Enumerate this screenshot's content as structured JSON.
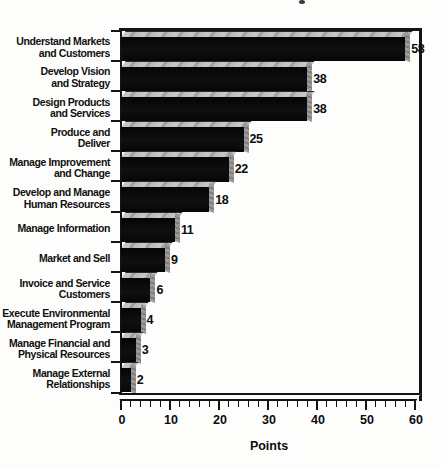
{
  "chart_data": {
    "type": "bar",
    "orientation": "horizontal",
    "title": "",
    "xlabel": "Points",
    "ylabel": "",
    "xlim": [
      0,
      60
    ],
    "x_major_ticks": [
      0,
      10,
      20,
      30,
      40,
      50,
      60
    ],
    "x_minor_tick_step": 2,
    "grid": false,
    "legend_position": "none",
    "value_labels_shown": true,
    "bar_color": "#0b0b0b",
    "bar_top_highlight_color": "#b8b8b8",
    "bar_end_face_color": "#8f8f8f",
    "frame_color": "#141414",
    "categories": [
      "Understand Markets and Customers",
      "Develop Vision and Strategy",
      "Design Products and Services",
      "Produce and Deliver",
      "Manage Improvement and Change",
      "Develop and Manage Human Resources",
      "Manage Information",
      "Market and Sell",
      "Invoice and Service Customers",
      "Execute Environmental Management Program",
      "Manage Financial and Physical Resources",
      "Manage External Relationships"
    ],
    "category_label_lines": [
      [
        "Understand Markets",
        "and Customers"
      ],
      [
        "Develop Vision",
        "and Strategy"
      ],
      [
        "Design Products",
        "and Services"
      ],
      [
        "Produce and",
        "Deliver"
      ],
      [
        "Manage Improvement",
        "and Change"
      ],
      [
        "Develop and Manage",
        "Human Resources"
      ],
      [
        "Manage Information"
      ],
      [
        "Market and Sell"
      ],
      [
        "Invoice and Service",
        "Customers"
      ],
      [
        "Execute Environmental",
        "Management Program"
      ],
      [
        "Manage Financial and",
        "Physical Resources"
      ],
      [
        "Manage External",
        "Relationships"
      ]
    ],
    "values": [
      58,
      38,
      38,
      25,
      22,
      18,
      11,
      9,
      6,
      4,
      3,
      2
    ]
  }
}
